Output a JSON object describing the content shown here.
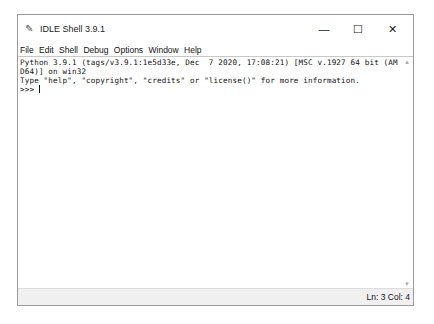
{
  "window": {
    "title": "IDLE Shell 3.9.1",
    "icon": "idle-feather-icon",
    "controls": {
      "minimize": "—",
      "maximize": "☐",
      "close": "✕"
    }
  },
  "menubar": {
    "items": [
      {
        "label": "File"
      },
      {
        "label": "Edit"
      },
      {
        "label": "Shell"
      },
      {
        "label": "Debug"
      },
      {
        "label": "Options"
      },
      {
        "label": "Window"
      },
      {
        "label": "Help"
      }
    ]
  },
  "shell": {
    "lines": [
      "Python 3.9.1 (tags/v3.9.1:1e5d33e, Dec  7 2020, 17:08:21) [MSC v.1927 64 bit (AM",
      "D64)] on win32",
      "Type \"help\", \"copyright\", \"credits\" or \"license()\" for more information."
    ],
    "prompt": ">>> "
  },
  "statusbar": {
    "position": "Ln: 3  Col: 4"
  },
  "colors": {
    "background": "#ffffff",
    "statusbar": "#f0f0f0",
    "border": "#9a9a9a"
  }
}
